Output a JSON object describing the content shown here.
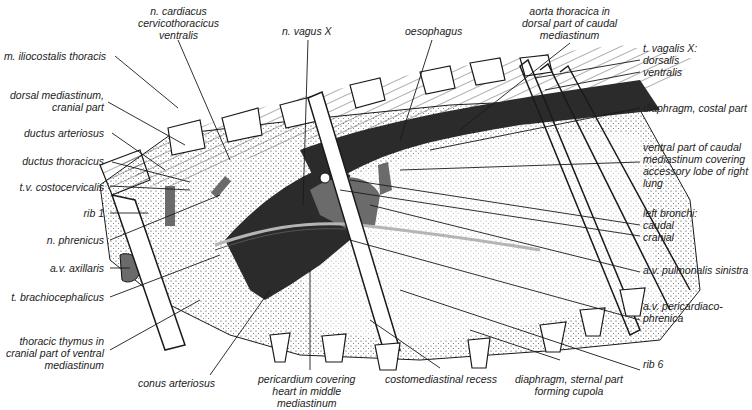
{
  "colors": {
    "background": "#ffffff",
    "dark_vessel": "#2b2b2b",
    "mid_gray": "#6b6b6b",
    "light_gray": "#b5b5b5",
    "line": "#1a1a1a",
    "label_text": "#222222"
  },
  "labels": {
    "top": {
      "n_cardiacus": "n. cardiacus\ncervicothoracicus\nventralis",
      "n_vagus": "n. vagus X",
      "oesophagus": "oesophagus",
      "aorta": "aorta thoracica in\ndorsal part of caudal\nmediastinum"
    },
    "left": {
      "m_iliocostalis": "m. iliocostalis thoracis",
      "dorsal_mediastinum": "dorsal mediastinum,\ncranial part",
      "ductus_arteriosus": "ductus arteriosus",
      "ductus_thoracicus": "ductus thoracicus",
      "tv_costocervicalis": "t.v. costocervicalis",
      "rib1": "rib 1",
      "n_phrenicus": "n. phrenicus",
      "av_axillaris": "a.v. axillaris",
      "t_brachiocephalicus": "t. brachiocephalicus",
      "thoracic_thymus": "thoracic thymus in\ncranial part of ventral\nmediastinum"
    },
    "right": {
      "t_vagalis": "t. vagalis X:\ndorsalis\nventralis",
      "diaphragm_costal": "diaphragm, costal part",
      "ventral_caudal": "ventral part of caudal\nmediastinum covering\naccessory lobe of right\nlung",
      "left_bronchi": "left bronchi:\ncaudal\ncranial",
      "av_pulmonalis": "a.v. pulmonalis sinistra",
      "av_pericardiaco": "a.v. pericardiaco-\nphrenica",
      "rib6": "rib 6"
    },
    "bottom": {
      "conus": "conus arteriosus",
      "pericardium": "pericardium covering\nheart in middle\nmediastinum",
      "costomediastinal": "costomediastinal recess",
      "diaphragm_sternal": "diaphragm, sternal part\nforming cupola"
    }
  }
}
